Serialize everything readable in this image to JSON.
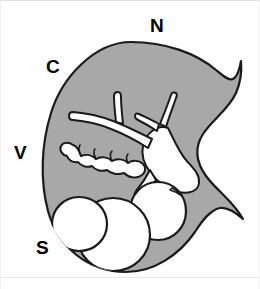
{
  "figure": {
    "background_color": "#ffffff",
    "frame_color": "#e8e8e8",
    "width": 260,
    "height": 289
  },
  "organ": {
    "name": "organ-body",
    "fill_color": "#a8a8a8",
    "outline_color": "#1a1a1a",
    "outline_width": 2,
    "description": "Crescent / kidney-shaped body with concave notch on the right side and two pointed tips"
  },
  "internal_structures": {
    "duct_tree": {
      "name": "branching-duct-tree",
      "fill_color": "#ffffff",
      "outline_color": "#1a1a1a",
      "branch_count": 4,
      "description": "White branching duct system radiating from central hilum, with two Y-shaped terminal bifurcations"
    },
    "lobulated_chain": {
      "name": "lobulated-chain",
      "fill_color": "#ffffff",
      "outline_color": "#1a1a1a",
      "lobule_count": 5,
      "description": "Chain of five rounded lobules extending left-downward from a duct branch"
    },
    "acini": {
      "name": "acinar-cluster",
      "fill_color": "#ffffff",
      "outline_color": "#1a1a1a",
      "count": 3,
      "description": "Three large overlapping spherical acini in the lower region"
    }
  },
  "labels": [
    {
      "id": "N",
      "text": "N",
      "position": "top",
      "x": 150,
      "y": 16,
      "name": "label-nasal"
    },
    {
      "id": "C",
      "text": "C",
      "position": "upper-left",
      "x": 46,
      "y": 57,
      "name": "label-cranial"
    },
    {
      "id": "V",
      "text": "V",
      "position": "left",
      "x": 14,
      "y": 143,
      "name": "label-ventral"
    },
    {
      "id": "S",
      "text": "S",
      "position": "lower-left",
      "x": 36,
      "y": 238,
      "name": "label-superior"
    }
  ],
  "colors": {
    "tissue_gray": "#a8a8a8",
    "outline_black": "#1a1a1a",
    "lumen_white": "#ffffff",
    "frame_gray": "#e8e8e8"
  }
}
